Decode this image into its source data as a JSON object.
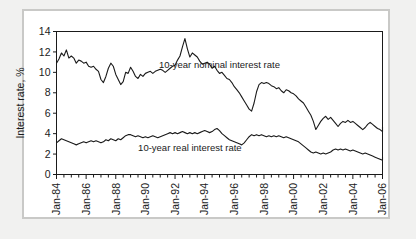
{
  "figure": {
    "background_color": "#f1f1f0",
    "frame_color": "#c9c9c7",
    "plot_background": "#ffffff",
    "axis_color": "#1a1a1a"
  },
  "chart_data": {
    "type": "line",
    "title": "",
    "xlabel": "",
    "ylabel": "Interest rate, %",
    "ylim": [
      0,
      14
    ],
    "yticks": [
      0,
      2,
      4,
      6,
      8,
      10,
      12,
      14
    ],
    "ytick_labels": [
      "0",
      "2",
      "4",
      "6",
      "8",
      "10",
      "12",
      "14"
    ],
    "grid": false,
    "legend_position": "inline-annotations",
    "xlim": [
      "Jan-84",
      "Jan-06"
    ],
    "xticks": [
      "Jan-84",
      "Jan-86",
      "Jan-88",
      "Jan-90",
      "Jan-92",
      "Jan-94",
      "Jan-96",
      "Jan-98",
      "Jan-00",
      "Jan-02",
      "Jan-04",
      "Jan-06"
    ],
    "x_minor_tick_interval_months": 6,
    "annotations": [
      {
        "text": "10-year nominal interest rate",
        "x": "Jan-95",
        "y": 10.4
      },
      {
        "text": "10-year real interest rate",
        "x": "Jan-93",
        "y": 2.3
      }
    ],
    "series": [
      {
        "name": "10-year nominal interest rate",
        "color": "#1a1a1a",
        "line_width": 1.1,
        "x_start": "Jan-84",
        "x_step_months": 2,
        "values": [
          10.9,
          11.3,
          11.9,
          11.6,
          12.2,
          11.4,
          11.6,
          11.4,
          10.9,
          11.2,
          11.1,
          10.9,
          11.0,
          10.6,
          10.5,
          10.6,
          10.3,
          10.1,
          9.3,
          9.0,
          9.6,
          10.4,
          10.9,
          10.6,
          9.8,
          9.3,
          8.8,
          9.1,
          10.0,
          9.9,
          10.5,
          10.1,
          9.6,
          9.4,
          9.8,
          9.6,
          9.9,
          10.0,
          10.1,
          9.9,
          10.1,
          10.2,
          10.3,
          10.2,
          10.0,
          10.2,
          10.4,
          10.6,
          10.7,
          11.2,
          11.6,
          12.5,
          13.3,
          12.3,
          11.5,
          11.9,
          11.7,
          11.5,
          11.1,
          10.8,
          10.9,
          11.0,
          10.8,
          10.4,
          10.6,
          10.2,
          9.9,
          10.0,
          9.7,
          9.4,
          9.3,
          9.0,
          8.6,
          8.3,
          8.0,
          7.6,
          7.2,
          6.8,
          6.4,
          6.2,
          7.0,
          8.1,
          8.8,
          9.0,
          8.9,
          9.0,
          8.9,
          8.7,
          8.6,
          8.4,
          8.5,
          8.2,
          8.0,
          8.3,
          8.2,
          8.0,
          7.9,
          7.7,
          7.4,
          7.2,
          7.0,
          6.6,
          6.2,
          5.8,
          5.2,
          4.4,
          4.8,
          5.2,
          5.5,
          5.7,
          5.4,
          5.6,
          5.3,
          5.0,
          4.7,
          5.0,
          5.2,
          5.1,
          5.3,
          5.1,
          5.2,
          5.0,
          4.8,
          4.6,
          4.4,
          4.6,
          4.9,
          5.1,
          4.9,
          4.7,
          4.5,
          4.4,
          4.2,
          4.3,
          4.5,
          4.7
        ]
      },
      {
        "name": "10-year real interest rate",
        "color": "#1a1a1a",
        "line_width": 1.1,
        "x_start": "Jan-84",
        "x_step_months": 2,
        "values": [
          3.1,
          3.3,
          3.5,
          3.4,
          3.3,
          3.2,
          3.1,
          3.0,
          2.9,
          3.0,
          3.1,
          3.2,
          3.1,
          3.2,
          3.3,
          3.2,
          3.3,
          3.2,
          3.1,
          3.2,
          3.4,
          3.3,
          3.5,
          3.4,
          3.3,
          3.5,
          3.4,
          3.6,
          3.8,
          3.9,
          3.9,
          3.8,
          3.7,
          3.8,
          3.7,
          3.6,
          3.7,
          3.6,
          3.7,
          3.8,
          3.7,
          3.6,
          3.7,
          3.8,
          3.9,
          4.0,
          4.1,
          4.0,
          4.1,
          4.0,
          4.1,
          4.2,
          4.1,
          4.0,
          4.1,
          4.0,
          4.1,
          4.0,
          4.1,
          4.2,
          4.3,
          4.2,
          4.1,
          4.2,
          4.4,
          4.5,
          4.3,
          4.0,
          3.8,
          3.6,
          3.4,
          3.3,
          3.2,
          3.1,
          3.0,
          2.9,
          3.1,
          3.4,
          3.7,
          3.9,
          3.8,
          3.9,
          3.8,
          3.9,
          3.8,
          3.7,
          3.8,
          3.7,
          3.8,
          3.7,
          3.8,
          3.7,
          3.6,
          3.7,
          3.6,
          3.5,
          3.4,
          3.3,
          3.2,
          3.0,
          2.8,
          2.6,
          2.4,
          2.2,
          2.1,
          2.2,
          2.1,
          2.0,
          2.1,
          2.0,
          2.1,
          2.2,
          2.4,
          2.5,
          2.4,
          2.5,
          2.4,
          2.5,
          2.4,
          2.3,
          2.4,
          2.3,
          2.2,
          2.1,
          2.0,
          2.1,
          2.0,
          1.9,
          1.8,
          1.7,
          1.6,
          1.5,
          1.4,
          1.5,
          1.7
        ]
      }
    ]
  }
}
